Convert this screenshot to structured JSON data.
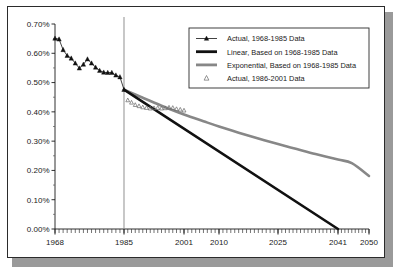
{
  "chart_data": {
    "type": "line",
    "title": "",
    "subtitle": "",
    "xlabel": "",
    "ylabel": "",
    "xlim": [
      1968,
      2050
    ],
    "ylim": [
      0.0,
      0.7
    ],
    "ytick_labels": [
      "0.70%",
      "0.60%",
      "0.50%",
      "0.40%",
      "0.30%",
      "0.20%",
      "0.10%",
      "0.00%"
    ],
    "ytick_values": [
      0.7,
      0.6,
      0.5,
      0.4,
      0.3,
      0.2,
      0.1,
      0.0
    ],
    "xtick_labels": [
      "1968",
      "1985",
      "2001",
      "2010",
      "2025",
      "2041",
      "2050"
    ],
    "xtick_values": [
      1968,
      1985,
      2001,
      2010,
      2025,
      2041,
      2050
    ],
    "grid": false,
    "minor_xticks": true,
    "legend_position": "top-right",
    "reference_line": {
      "x": 1985,
      "color": "#8a8a8a",
      "label": ""
    },
    "series": [
      {
        "name": "Actual, 1968-1985 Data",
        "style": "line-marker",
        "marker": "filled-triangle",
        "color": "#111111",
        "x": [
          1968,
          1969,
          1970,
          1971,
          1972,
          1973,
          1974,
          1975,
          1976,
          1977,
          1978,
          1979,
          1980,
          1981,
          1982,
          1983,
          1984,
          1985
        ],
        "y": [
          0.651,
          0.648,
          0.612,
          0.592,
          0.583,
          0.566,
          0.549,
          0.562,
          0.58,
          0.566,
          0.552,
          0.541,
          0.535,
          0.534,
          0.534,
          0.525,
          0.519,
          0.476
        ]
      },
      {
        "name": "Linear, Based on 1968-1985 Data",
        "style": "thick-line",
        "color": "#111111",
        "x": [
          1985,
          2041
        ],
        "y": [
          0.476,
          0.0
        ]
      },
      {
        "name": "Exponential, Based on 1968-1985 Data",
        "style": "thick-line",
        "color": "#878787",
        "x": [
          1985,
          1990,
          1995,
          2001,
          2006,
          2010,
          2015,
          2020,
          2025,
          2030,
          2035,
          2041,
          2045,
          2050
        ],
        "y": [
          0.476,
          0.448,
          0.421,
          0.391,
          0.368,
          0.35,
          0.329,
          0.309,
          0.29,
          0.273,
          0.256,
          0.237,
          0.225,
          0.181
        ]
      },
      {
        "name": "Actual, 1986-2001 Data",
        "style": "marker-only",
        "marker": "hollow-triangle",
        "color": "#6f6f6f",
        "x": [
          1986,
          1987,
          1988,
          1989,
          1990,
          1991,
          1992,
          1993,
          1994,
          1995,
          1996,
          1997,
          1998,
          1999,
          2000,
          2001
        ],
        "y": [
          0.44,
          0.432,
          0.424,
          0.42,
          0.416,
          0.414,
          0.412,
          0.413,
          0.414,
          0.412,
          0.413,
          0.415,
          0.414,
          0.41,
          0.408,
          0.405
        ]
      }
    ],
    "legend": [
      {
        "label": "Actual, 1968-1985 Data",
        "swatch": "line-with-filled-triangle",
        "color": "#111111"
      },
      {
        "label": "Linear, Based on 1968-1985 Data",
        "swatch": "thick-line",
        "color": "#111111"
      },
      {
        "label": "Exponential, Based on 1968-1985 Data",
        "swatch": "thick-line",
        "color": "#878787"
      },
      {
        "label": "Actual, 1986-2001 Data",
        "swatch": "hollow-triangle",
        "color": "#7a7a7a"
      }
    ]
  }
}
